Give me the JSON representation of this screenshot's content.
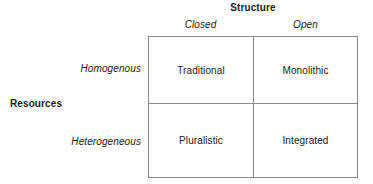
{
  "matrix": {
    "column_axis_label": "Structure",
    "row_axis_label": "Resources",
    "column_headers": [
      {
        "label": "Closed"
      },
      {
        "label": "Open"
      }
    ],
    "row_headers": [
      {
        "label": "Homogenous"
      },
      {
        "label": "Heterogeneous"
      }
    ],
    "cells": [
      [
        {
          "label": "Traditional"
        },
        {
          "label": "Monolithic"
        }
      ],
      [
        {
          "label": "Pluralistic"
        },
        {
          "label": "Integrated"
        }
      ]
    ],
    "colors": {
      "border": "#8a8a8a",
      "text": "#1a1a1a",
      "background": "#ffffff"
    }
  }
}
